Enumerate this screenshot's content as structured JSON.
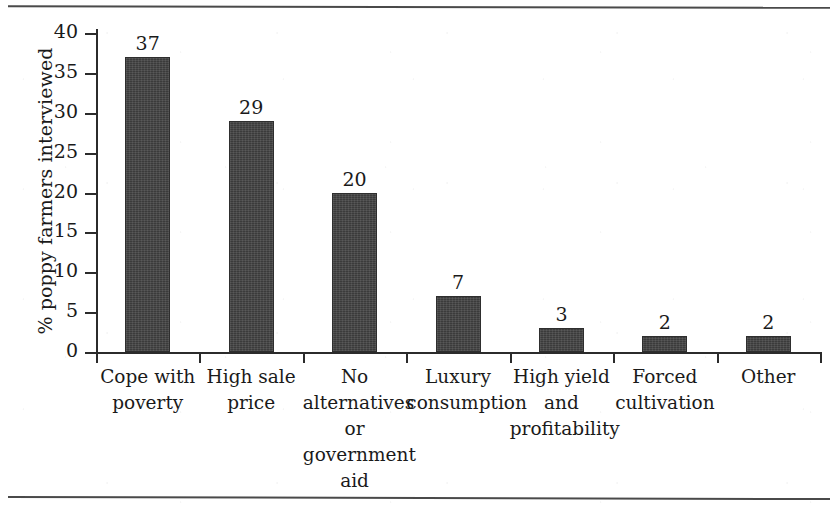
{
  "figure": {
    "name": "poppy-farmers-reasons-bar-chart",
    "background_color": "#ffffff",
    "bar_color": "#3b3b3b",
    "axis_color": "#2b2b2b",
    "text_color": "#1a1a1a"
  },
  "chart_data": {
    "type": "bar",
    "title": "",
    "xlabel": "",
    "ylabel": "% poppy farmers interviewed",
    "ylim": [
      0,
      40
    ],
    "yticks": [
      0,
      5,
      10,
      15,
      20,
      25,
      30,
      35,
      40
    ],
    "grid": false,
    "legend": null,
    "categories": [
      "Cope with poverty",
      "High sale price",
      "No alternatives or government aid",
      "Luxury consumption",
      "High yield and profitability",
      "Forced cultivation",
      "Other"
    ],
    "category_label_lines": [
      [
        "Cope with",
        "poverty"
      ],
      [
        "High sale",
        "price"
      ],
      [
        "No",
        "alternatives",
        "or",
        "government",
        "aid"
      ],
      [
        "Luxury",
        "consumption"
      ],
      [
        "High yield",
        "and",
        "profitability"
      ],
      [
        "Forced",
        "cultivation"
      ],
      [
        "Other"
      ]
    ],
    "values": [
      37,
      29,
      20,
      7,
      3,
      2,
      2
    ],
    "value_labels": [
      "37",
      "29",
      "20",
      "7",
      "3",
      "2",
      "2"
    ]
  },
  "rules": {
    "top_rule_label": "top-page-rule",
    "bottom_rule_label": "bottom-page-rule"
  }
}
